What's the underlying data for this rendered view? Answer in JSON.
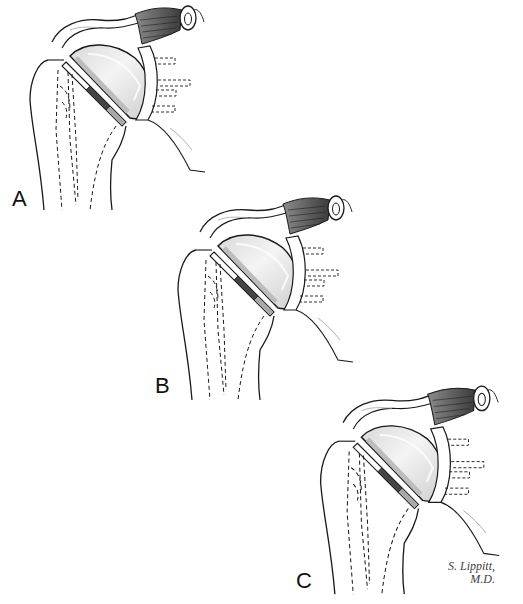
{
  "figure": {
    "panels": [
      {
        "id": "A",
        "label": "A"
      },
      {
        "id": "B",
        "label": "B"
      },
      {
        "id": "C",
        "label": "C"
      }
    ],
    "signature": {
      "line1": "S. Lippitt,",
      "line2": "M.D."
    },
    "colors": {
      "line": "#1a1a1a",
      "muscle": "#555555",
      "head_fill": "#e6e6e6",
      "head_highlight": "#f7f7f7",
      "collar": "#c8c8c8",
      "stem_dark": "#444444"
    }
  }
}
